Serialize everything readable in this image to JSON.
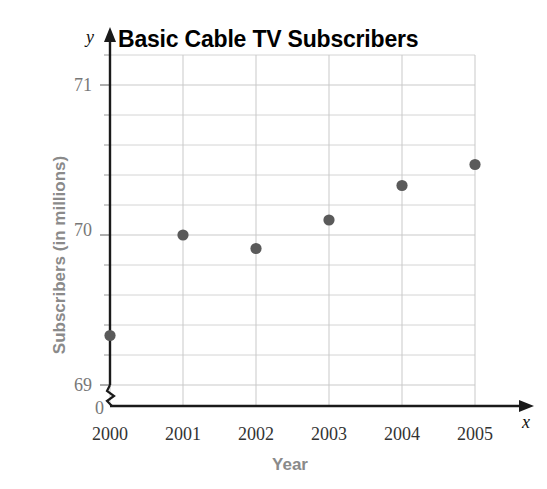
{
  "chart_data": {
    "type": "scatter",
    "title": "Basic Cable TV Subscribers",
    "xlabel": "Year",
    "ylabel": "Subscribers (in millions)",
    "x": [
      2000,
      2001,
      2002,
      2003,
      2004,
      2005
    ],
    "categories": [
      "2000",
      "2001",
      "2002",
      "2003",
      "2004",
      "2005"
    ],
    "values": [
      69.33,
      70.0,
      69.91,
      70.1,
      70.33,
      70.47
    ],
    "series": [
      {
        "name": "Subscribers (in millions)",
        "values": [
          69.33,
          70.0,
          69.91,
          70.1,
          70.33,
          70.47
        ]
      }
    ],
    "points": [
      {
        "year": "2000",
        "value": 69.33
      },
      {
        "year": "2001",
        "value": 70.0
      },
      {
        "year": "2002",
        "value": 69.91
      },
      {
        "year": "2003",
        "value": 70.1
      },
      {
        "year": "2004",
        "value": 70.33
      },
      {
        "year": "2005",
        "value": 70.47
      }
    ],
    "ylim": [
      69.0,
      71.2
    ],
    "xlim": [
      2000,
      2005
    ],
    "y_major_ticks": [
      69,
      70,
      71
    ],
    "y_minor_step": 0.2,
    "grid": true,
    "legend": null,
    "axis_break": true,
    "axis_origin_label": "0",
    "x_axis_variable": "x",
    "y_axis_variable": "y",
    "marker_color": "#5a5a5a",
    "grid_color": "#c9c9c9",
    "axis_color": "#1a1a1a",
    "title_color": "#000000",
    "axis_title_color": "#8a8a8a"
  },
  "axis": {
    "y_ticks": [
      {
        "label": "71"
      },
      {
        "label": "70"
      },
      {
        "label": "69"
      },
      {
        "label": "0"
      }
    ],
    "x_ticks": [
      {
        "label": "2000"
      },
      {
        "label": "2001"
      },
      {
        "label": "2002"
      },
      {
        "label": "2003"
      },
      {
        "label": "2004"
      },
      {
        "label": "2005"
      }
    ]
  }
}
